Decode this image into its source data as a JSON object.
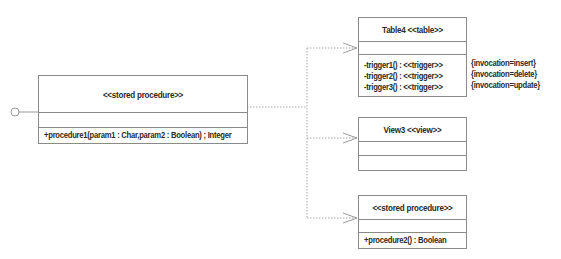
{
  "diagram": {
    "type": "UML class diagram",
    "main_procedure": {
      "stereotype": "<<stored procedure>>",
      "attributes": [],
      "operations": [
        "+procedure1(param1 : Char,param2 : Boolean) ; Integer"
      ],
      "interface_lollipop": true
    },
    "table4": {
      "title": "Table4 <<table>>",
      "attributes": [],
      "operations": [
        "-trigger1() : <<trigger>>",
        "-trigger2() : <<trigger>>",
        "-trigger3() : <<trigger>>"
      ],
      "tagged_values": [
        "{invocation=insert}",
        "{invocation=delete}",
        "{invocation=update}"
      ]
    },
    "view3": {
      "title": "View3 <<view>>",
      "attributes": [],
      "operations": []
    },
    "procedure2": {
      "stereotype": "<<stored procedure>>",
      "attributes": [],
      "operations": [
        "+procedure2() : Boolean"
      ]
    },
    "relationships": [
      {
        "from": "main_procedure",
        "to": "table4",
        "kind": "dependency"
      },
      {
        "from": "main_procedure",
        "to": "view3",
        "kind": "dependency"
      },
      {
        "from": "main_procedure",
        "to": "procedure2",
        "kind": "dependency"
      }
    ],
    "colors": {
      "line": "#8a8a8a",
      "text": "#2a2a2a",
      "background": "#ffffff"
    }
  }
}
